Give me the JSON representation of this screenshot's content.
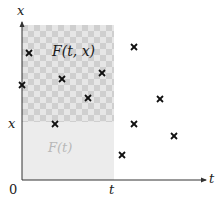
{
  "diagram": {
    "axes": {
      "x_axis_label": "t",
      "y_axis_label": "x",
      "origin_label": "0",
      "t_tick_label": "t",
      "x_tick_label": "x"
    },
    "regions": {
      "upper_label": "F(t, x)",
      "lower_label": "F(t)"
    },
    "markers": [
      {
        "x": 29,
        "y": 53
      },
      {
        "x": 22,
        "y": 85
      },
      {
        "x": 62,
        "y": 79
      },
      {
        "x": 102,
        "y": 73
      },
      {
        "x": 88,
        "y": 98
      },
      {
        "x": 55,
        "y": 124
      },
      {
        "x": 122,
        "y": 155
      },
      {
        "x": 134,
        "y": 47
      },
      {
        "x": 160,
        "y": 99
      },
      {
        "x": 134,
        "y": 124
      },
      {
        "x": 174,
        "y": 136
      }
    ],
    "colors": {
      "axis": "#333333",
      "checker_light": "#e6e6e6",
      "checker_dark": "#cfcfcf",
      "lower_fill": "#ececec",
      "marker": "#111111",
      "faint_label": "#b8b8b8"
    }
  }
}
